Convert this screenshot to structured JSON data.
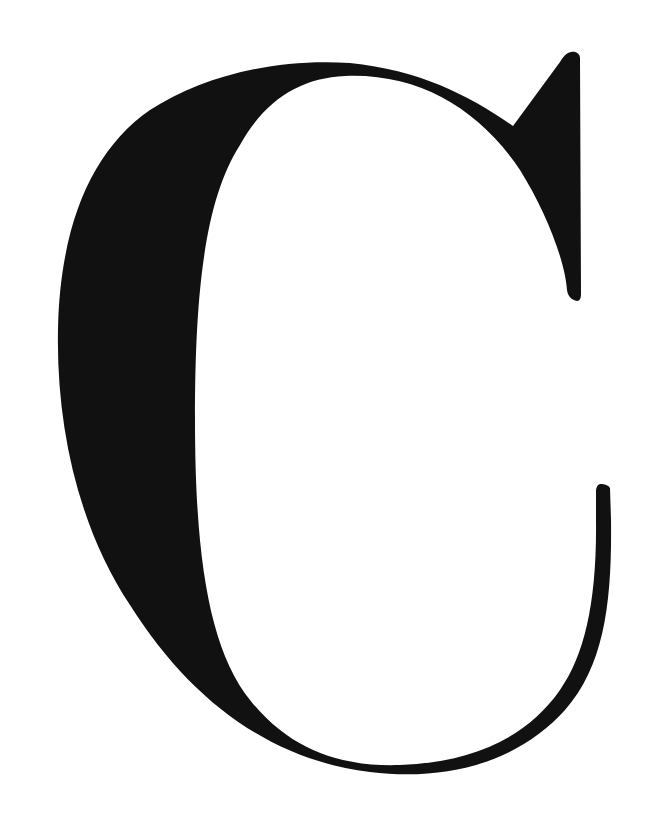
{
  "glyph": {
    "character": "C",
    "color": "#111111",
    "background": "#ffffff"
  }
}
